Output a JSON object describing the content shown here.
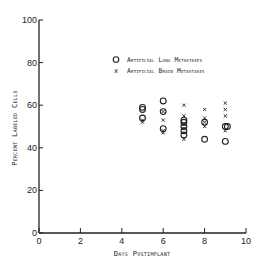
{
  "chart_data": {
    "type": "scatter",
    "title": "",
    "xlabel": "Days Postimplant",
    "ylabel": "Percent Labeled Cells",
    "xlim": [
      0,
      10
    ],
    "ylim": [
      0,
      100
    ],
    "x_ticks": [
      0,
      2,
      4,
      6,
      8,
      10
    ],
    "y_ticks": [
      0,
      20,
      40,
      60,
      80,
      100
    ],
    "grid": false,
    "legend_position": "upper right",
    "series": [
      {
        "name": "Artificial Lung Metastases",
        "marker": "circle",
        "points": [
          [
            5,
            59
          ],
          [
            5,
            58
          ],
          [
            5,
            54
          ],
          [
            6,
            62
          ],
          [
            6,
            57
          ],
          [
            6,
            49
          ],
          [
            7,
            53
          ],
          [
            7,
            52
          ],
          [
            7,
            50
          ],
          [
            7,
            48
          ],
          [
            7,
            46
          ],
          [
            8,
            52
          ],
          [
            8,
            44
          ],
          [
            9,
            50
          ],
          [
            9.1,
            50
          ],
          [
            9,
            43
          ]
        ]
      },
      {
        "name": "Artificial Brain Metastases",
        "marker": "x",
        "points": [
          [
            5,
            53
          ],
          [
            5,
            52
          ],
          [
            6,
            57
          ],
          [
            6,
            53
          ],
          [
            6,
            48
          ],
          [
            6,
            47
          ],
          [
            7,
            60
          ],
          [
            7,
            55
          ],
          [
            7,
            51
          ],
          [
            7,
            49
          ],
          [
            7,
            44
          ],
          [
            8,
            58
          ],
          [
            8,
            54
          ],
          [
            8,
            52
          ],
          [
            8,
            50
          ],
          [
            9,
            61
          ],
          [
            9,
            58
          ],
          [
            9,
            55
          ],
          [
            9,
            48
          ]
        ]
      }
    ]
  },
  "axes": {
    "x_title": "Days Postimplant",
    "y_title": "Percent Labeled Cells",
    "x_tick_labels": [
      "0",
      "2",
      "4",
      "6",
      "8",
      "10"
    ],
    "y_tick_labels": [
      "0",
      "20",
      "40",
      "60",
      "80",
      "100"
    ]
  },
  "legend": {
    "items": [
      {
        "symbol": "circle",
        "label": "Artificial Lung Metastases"
      },
      {
        "symbol": "x",
        "label": "Artificial Brain Metastases"
      }
    ]
  },
  "colors": {
    "ink": "#222222",
    "background": "#ffffff"
  }
}
